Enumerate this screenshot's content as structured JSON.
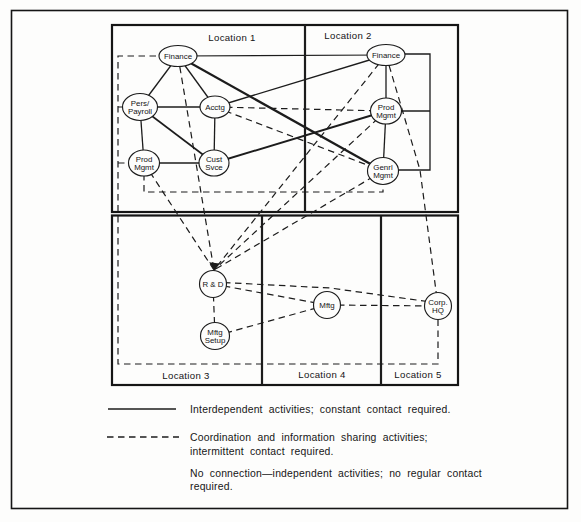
{
  "figure": {
    "background": "#fdfdfc",
    "line_color": "#1c1c1c",
    "frame": {
      "x": 11.5,
      "y": 10.5,
      "w": 556,
      "h": 498,
      "stroke_width": 1.6
    }
  },
  "diagram": {
    "boxes": [
      {
        "id": "top-half",
        "x": 112,
        "y": 25,
        "w": 346,
        "h": 187,
        "stroke_width": 2.2
      },
      {
        "id": "bottom-half",
        "x": 112,
        "y": 215.5,
        "w": 346,
        "h": 169.5,
        "stroke_width": 2.2
      }
    ],
    "dividers": [
      {
        "id": "loc1-loc2",
        "x1": 305,
        "y1": 25,
        "x2": 305,
        "y2": 212,
        "stroke_width": 2.2
      },
      {
        "id": "loc3-loc4",
        "x1": 262,
        "y1": 215.5,
        "x2": 262,
        "y2": 385,
        "stroke_width": 2.2
      },
      {
        "id": "loc4-loc5",
        "x1": 381,
        "y1": 215.5,
        "x2": 381,
        "y2": 385,
        "stroke_width": 2.2
      }
    ],
    "location_labels": [
      {
        "id": "location-1",
        "text": "Location 1",
        "x": 232,
        "y": 41
      },
      {
        "id": "location-2",
        "text": "Location 2",
        "x": 348,
        "y": 39
      },
      {
        "id": "location-3",
        "text": "Location 3",
        "x": 186,
        "y": 379
      },
      {
        "id": "location-4",
        "text": "Location 4",
        "x": 322,
        "y": 378
      },
      {
        "id": "location-5",
        "text": "Location 5",
        "x": 418,
        "y": 378
      }
    ],
    "nodes": [
      {
        "id": "finance1",
        "label": "Finance",
        "x": 178,
        "y": 56,
        "rx": 19,
        "ry": 10.5
      },
      {
        "id": "pers_payroll",
        "label": "Pers/|Payroll",
        "x": 140,
        "y": 107,
        "rx": 17.5,
        "ry": 13.5
      },
      {
        "id": "acctg",
        "label": "Acctg",
        "x": 215,
        "y": 107,
        "rx": 15,
        "ry": 11
      },
      {
        "id": "prod_mgmt1",
        "label": "Prod|Mgmt",
        "x": 144,
        "y": 163,
        "rx": 15.5,
        "ry": 13
      },
      {
        "id": "cust_svce",
        "label": "Cust|Svce",
        "x": 214,
        "y": 163,
        "rx": 15,
        "ry": 13
      },
      {
        "id": "finance2",
        "label": "Finance",
        "x": 386,
        "y": 55,
        "rx": 19,
        "ry": 10.5
      },
      {
        "id": "prod_mgmt2",
        "label": "Prod|Mgmt",
        "x": 386,
        "y": 111,
        "rx": 15.5,
        "ry": 13
      },
      {
        "id": "genrl_mgmt2",
        "label": "Genrl|Mgmt",
        "x": 383,
        "y": 171,
        "rx": 15.5,
        "ry": 13.5
      },
      {
        "id": "rnd",
        "label": "R & D",
        "x": 213,
        "y": 284,
        "rx": 13.5,
        "ry": 13.5
      },
      {
        "id": "mftg_setup",
        "label": "Mftg|Setup",
        "x": 215,
        "y": 336,
        "rx": 14.5,
        "ry": 13.5
      },
      {
        "id": "mftg",
        "label": "Mftg",
        "x": 327,
        "y": 305,
        "rx": 13.5,
        "ry": 13.5
      },
      {
        "id": "corp_hq",
        "label": "Corp.|HQ",
        "x": 438,
        "y": 306,
        "rx": 13.5,
        "ry": 13.5
      }
    ],
    "edges": [
      {
        "from": "finance1",
        "to": "pers_payroll",
        "style": "solid",
        "w": 1.3
      },
      {
        "from": "finance1",
        "to": "acctg",
        "style": "solid",
        "w": 1.3
      },
      {
        "from": "finance1",
        "to": "finance2",
        "style": "solid",
        "w": 1.2
      },
      {
        "from": "finance1",
        "to": "genrl_mgmt2",
        "style": "solid",
        "w": 2.2
      },
      {
        "from": "pers_payroll",
        "to": "acctg",
        "style": "solid",
        "w": 1.3
      },
      {
        "from": "pers_payroll",
        "to": "prod_mgmt1",
        "style": "solid",
        "w": 1.3
      },
      {
        "from": "pers_payroll",
        "to": "cust_svce",
        "style": "solid",
        "w": 1.6
      },
      {
        "from": "acctg",
        "to": "cust_svce",
        "style": "solid",
        "w": 1.3
      },
      {
        "from": "acctg",
        "to": "finance2",
        "style": "solid",
        "w": 1.4
      },
      {
        "from": "prod_mgmt1",
        "to": "cust_svce",
        "style": "solid",
        "w": 1.3
      },
      {
        "from": "cust_svce",
        "to": "prod_mgmt2",
        "style": "solid",
        "w": 1.9
      },
      {
        "from": "finance2",
        "to": "prod_mgmt2",
        "style": "solid",
        "w": 1.3
      },
      {
        "from": "prod_mgmt2",
        "to": "genrl_mgmt2",
        "style": "solid",
        "w": 1.3
      },
      {
        "points": [
          [
            386,
            54
          ],
          [
            430,
            54
          ],
          [
            430,
            170
          ],
          [
            383,
            170
          ]
        ],
        "style": "solid",
        "w": 1.3
      },
      {
        "points": [
          [
            386,
            111
          ],
          [
            430,
            111
          ]
        ],
        "style": "solid",
        "w": 1.3
      },
      {
        "from": "acctg",
        "to": "prod_mgmt2",
        "style": "dashed",
        "w": 1.2
      },
      {
        "from": "acctg",
        "to": "genrl_mgmt2",
        "style": "dashed",
        "w": 1.2
      },
      {
        "points": [
          [
            178,
            56
          ],
          [
            214,
            270
          ]
        ],
        "style": "dashed",
        "w": 1.2
      },
      {
        "points": [
          [
            144,
            163
          ],
          [
            214,
            270
          ]
        ],
        "style": "dashed",
        "w": 1.2
      },
      {
        "points": [
          [
            386,
            55
          ],
          [
            214,
            270
          ]
        ],
        "style": "dashed",
        "w": 1.2
      },
      {
        "points": [
          [
            386,
            111
          ],
          [
            214,
            270
          ]
        ],
        "style": "dashed",
        "w": 1.2
      },
      {
        "points": [
          [
            383,
            171
          ],
          [
            214,
            270
          ]
        ],
        "style": "dashed",
        "w": 1.2
      },
      {
        "points": [
          [
            144,
            163
          ],
          [
            144,
            192
          ],
          [
            383,
            192
          ],
          [
            383,
            171
          ]
        ],
        "style": "dashed",
        "w": 1.2
      },
      {
        "points": [
          [
            178,
            56
          ],
          [
            118,
            56
          ],
          [
            118,
            364
          ],
          [
            438,
            364
          ],
          [
            438,
            306
          ]
        ],
        "style": "dashed",
        "w": 1.2
      },
      {
        "points": [
          [
            118,
            107
          ],
          [
            140,
            107
          ]
        ],
        "style": "dashed",
        "w": 1.2
      },
      {
        "points": [
          [
            118,
            163
          ],
          [
            144,
            163
          ]
        ],
        "style": "dashed",
        "w": 1.2
      },
      {
        "points": [
          [
            386,
            55
          ],
          [
            420,
            170
          ],
          [
            438,
            306
          ]
        ],
        "style": "dashed",
        "w": 1.2
      },
      {
        "points": [
          [
            213,
            282
          ],
          [
            330,
            288
          ],
          [
            438,
            303
          ]
        ],
        "style": "dashed",
        "w": 1.2
      },
      {
        "from": "rnd",
        "to": "mftg",
        "style": "dashed",
        "w": 1.2
      },
      {
        "from": "rnd",
        "to": "mftg_setup",
        "style": "dashed",
        "w": 1.2
      },
      {
        "from": "mftg_setup",
        "to": "mftg",
        "style": "dashed",
        "w": 1.2
      },
      {
        "from": "mftg",
        "to": "corp_hq",
        "style": "dashed",
        "w": 1.2
      }
    ],
    "arrowhead": {
      "tip_x": 214.5,
      "tip_y": 270.5,
      "points": "214.5,271 209.2,262.2 219.4,263.4"
    }
  },
  "legend": {
    "items": [
      {
        "sample": "solid",
        "lines": [
          "Interdependent activities; constant contact required."
        ]
      },
      {
        "sample": "dashed",
        "lines": [
          "Coordination and information sharing activities;",
          "intermittent contact required."
        ]
      },
      {
        "sample": "none",
        "lines": [
          "No connection—independent activities; no regular contact",
          "required."
        ]
      }
    ]
  }
}
